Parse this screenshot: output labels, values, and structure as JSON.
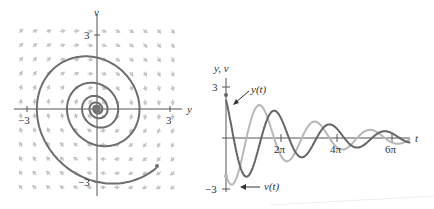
{
  "phase_plane": {
    "x_axis_label": "y",
    "y_axis_label": "v",
    "x_ticks": [
      "−3",
      "3"
    ],
    "y_ticks": [
      "3",
      "−3"
    ],
    "colors": {
      "axis": "#555555",
      "trajectory": "#6e6e6e",
      "field": "#bdbdbd"
    }
  },
  "time_plot": {
    "y_axis_label": "y, v",
    "x_axis_label": "t",
    "y_ticks": [
      "3",
      "−3"
    ],
    "x_ticks": [
      "2π",
      "4π",
      "6π"
    ],
    "curve_labels": {
      "y": "y(t)",
      "v": "v(t)"
    },
    "colors": {
      "y_curve": "#6a6a6a",
      "v_curve": "#b5b5b5",
      "axis": "#555555"
    }
  },
  "chart_data": [
    {
      "type": "line",
      "title": "Phase plane spiral (y, v)",
      "xlabel": "y",
      "ylabel": "v",
      "xlim": [
        -3.5,
        3.5
      ],
      "ylim": [
        -3.5,
        3.5
      ],
      "series": [
        {
          "name": "trajectory",
          "description": "spiral sink from (2.3, -2.1) into origin"
        }
      ]
    },
    {
      "type": "line",
      "title": "Damped oscillation",
      "xlabel": "t",
      "ylabel": "y, v",
      "x_ticks": [
        "2π",
        "4π",
        "6π"
      ],
      "ylim": [
        -3,
        3
      ],
      "series": [
        {
          "name": "y(t)",
          "initial": 2.3,
          "description": "damped cosine-like decay"
        },
        {
          "name": "v(t)",
          "initial": -2.1,
          "description": "damped oscillation, phase shifted"
        }
      ]
    }
  ]
}
